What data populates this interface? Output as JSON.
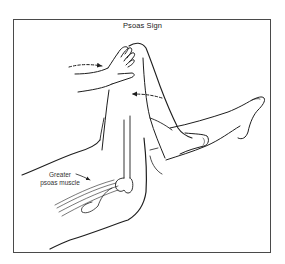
{
  "figure": {
    "title": "Psoas Sign",
    "labels": {
      "muscle_line1": "Greater",
      "muscle_line2": "psoas muscle"
    },
    "arrows": [
      {
        "name": "hand-push-arrow",
        "direction": "right",
        "style": "dashed"
      },
      {
        "name": "leg-resist-arrow",
        "direction": "left",
        "style": "dashed"
      }
    ],
    "colors": {
      "line": "#1e1e1e",
      "frame": "#4a4a4a",
      "background": "#ffffff"
    }
  }
}
